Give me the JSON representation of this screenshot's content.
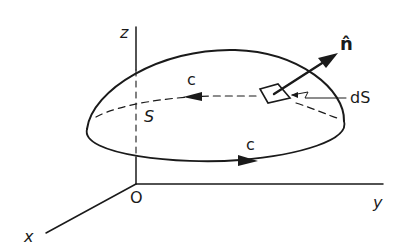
{
  "diagram": {
    "type": "surface-with-boundary-curve",
    "colors": {
      "ink": "#1a1a1a",
      "background": "#ffffff"
    },
    "labels": {
      "z_axis": "z",
      "y_axis": "y",
      "x_axis": "x",
      "origin": "O",
      "surface": "S",
      "curve_top": "c",
      "curve_bottom": "c",
      "normal": "n̂",
      "element": "dS"
    }
  }
}
